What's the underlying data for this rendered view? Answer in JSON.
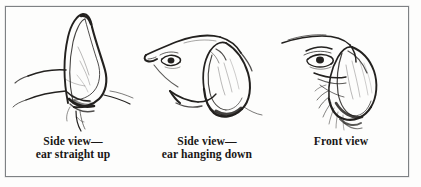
{
  "figure": {
    "type": "illustration-plate",
    "medium": "pen-and-ink line drawing",
    "border_color": "#7e8184",
    "ink_color": "#191716",
    "paper_color": "#fdfdfc",
    "panel_count": 3
  },
  "panels": [
    {
      "id": "ear-straight-up",
      "art_name": "dog-ear-straight-up-drawing",
      "caption_line1": "Side view—",
      "caption_line2": "ear straight up",
      "lines": 2
    },
    {
      "id": "ear-hanging-down",
      "art_name": "dog-head-ear-hanging-down-drawing",
      "caption_line1": "Side view—",
      "caption_line2": "ear hanging down",
      "lines": 2
    },
    {
      "id": "front-view",
      "art_name": "dog-head-front-view-drawing",
      "caption_line1": "Front view",
      "caption_line2": "",
      "lines": 1
    }
  ]
}
